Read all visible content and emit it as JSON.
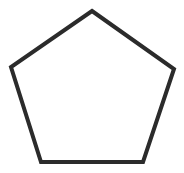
{
  "canvas": {
    "width": 184,
    "height": 173,
    "background": "#ffffff"
  },
  "shape": {
    "type": "pentagon",
    "points": "92,11 174,69 143,162 41,162 11,67",
    "stroke": "#2b2b2b",
    "stroke_width": 4,
    "fill": "#ffffff"
  }
}
